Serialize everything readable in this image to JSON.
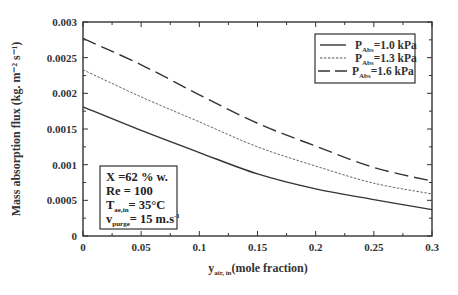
{
  "chart_data": {
    "type": "line",
    "title": "",
    "xlabel": "y_air, in (mole fraction)",
    "xlabel_main": "y",
    "xlabel_sub": "air, in",
    "xlabel_rest": "(mole  fraction)",
    "ylabel": "Mass absorption flux (kg. m⁻² s⁻¹)",
    "xlim": [
      0,
      0.3
    ],
    "ylim": [
      0,
      0.003
    ],
    "x_ticks": [
      "0",
      "0.05",
      "0.1",
      "0.15",
      "0.2",
      "0.25",
      "0.3"
    ],
    "y_ticks": [
      "0",
      "0.0005",
      "0.001",
      "0.0015",
      "0.002",
      "0.0025",
      "0.003"
    ],
    "grid": false,
    "legend_position": "upper right",
    "x": [
      0,
      0.05,
      0.1,
      0.15,
      0.2,
      0.25,
      0.3
    ],
    "series": [
      {
        "name": "P_Abs=1.0 kPa",
        "label_main": "P",
        "label_sub": "Abs",
        "label_rest": "=1.0 kPa",
        "style": "solid",
        "values": [
          0.00181,
          0.00148,
          0.00117,
          0.00087,
          0.00066,
          0.00051,
          0.00037
        ]
      },
      {
        "name": "P_Abs=1.3 kPa",
        "label_main": "P",
        "label_sub": "Abs",
        "label_rest": "=1.3 kPa",
        "style": "dotted",
        "values": [
          0.00233,
          0.00195,
          0.0016,
          0.00125,
          0.00098,
          0.00074,
          0.00059
        ]
      },
      {
        "name": "P_Abs=1.6 kPa",
        "label_main": "P",
        "label_sub": "Abs",
        "label_rest": "=1.6 kPa",
        "style": "dashed",
        "values": [
          0.00277,
          0.0024,
          0.00198,
          0.00158,
          0.00126,
          0.00096,
          0.00077
        ]
      }
    ],
    "annotation": {
      "lines": [
        {
          "main": "X =62 % w.",
          "sub": "",
          "rest": ""
        },
        {
          "main": "Re = 100",
          "sub": "",
          "rest": ""
        },
        {
          "main": "T",
          "sub": "ae,in",
          "rest": "= 35°C"
        },
        {
          "main": "v",
          "sub": "purge",
          "rest": "= 15 m.s",
          "sup": "-1"
        }
      ]
    }
  }
}
